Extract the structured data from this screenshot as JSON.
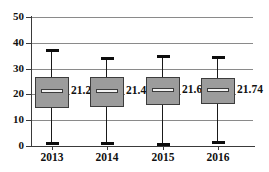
{
  "chart_data": {
    "type": "box",
    "title": "",
    "xlabel": "",
    "ylabel": "",
    "ylim": [
      0,
      50
    ],
    "yticks": [
      0,
      10,
      20,
      30,
      40,
      50
    ],
    "grid": true,
    "legend": "none",
    "categories": [
      "2013",
      "2014",
      "2015",
      "2016"
    ],
    "boxes": [
      {
        "category": "2013",
        "whisker_low": 1.4,
        "q1": 14.6,
        "median": 21.26,
        "q3": 26.9,
        "whisker_high": 37.5,
        "label": "21.26"
      },
      {
        "category": "2014",
        "whisker_low": 1.5,
        "q1": 15.3,
        "median": 21.46,
        "q3": 26.6,
        "whisker_high": 34.6,
        "label": "21.46"
      },
      {
        "category": "2015",
        "whisker_low": 1.3,
        "q1": 15.7,
        "median": 21.69,
        "q3": 26.8,
        "whisker_high": 35.2,
        "label": "21.69"
      },
      {
        "category": "2016",
        "whisker_low": 1.8,
        "q1": 16.2,
        "median": 21.74,
        "q3": 26.2,
        "whisker_high": 34.8,
        "label": "21.74"
      }
    ],
    "colors": {
      "box_fill": "#9c9c9c",
      "box_border": "#3c3c3c",
      "median_fill": "#f2f2f2",
      "whisker": "#1a1a1a",
      "gridline": "#8a8a8a",
      "axis": "#3a3a3a",
      "text": "#111111",
      "background": "#ffffff"
    }
  },
  "axis": {
    "y_labels": [
      "50",
      "40",
      "30",
      "20",
      "10",
      "0"
    ],
    "x_labels": [
      "2013",
      "2014",
      "2015",
      "2016"
    ]
  },
  "title_remnant": ""
}
